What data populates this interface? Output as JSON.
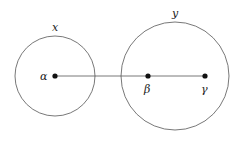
{
  "diagram": {
    "circles": [
      {
        "id": "x",
        "label": "x",
        "cx": 55,
        "cy": 76,
        "r": 40
      },
      {
        "id": "y",
        "label": "y",
        "cx": 175,
        "cy": 76,
        "r": 54
      }
    ],
    "points": [
      {
        "id": "alpha",
        "label": "α",
        "cx": 55,
        "cy": 76
      },
      {
        "id": "beta",
        "label": "β",
        "cx": 148,
        "cy": 76
      },
      {
        "id": "gamma",
        "label": "γ",
        "cx": 205,
        "cy": 76
      }
    ],
    "edge": {
      "from": "alpha",
      "to": "gamma"
    },
    "colors": {
      "stroke": "#555555",
      "point": "#111111"
    }
  }
}
